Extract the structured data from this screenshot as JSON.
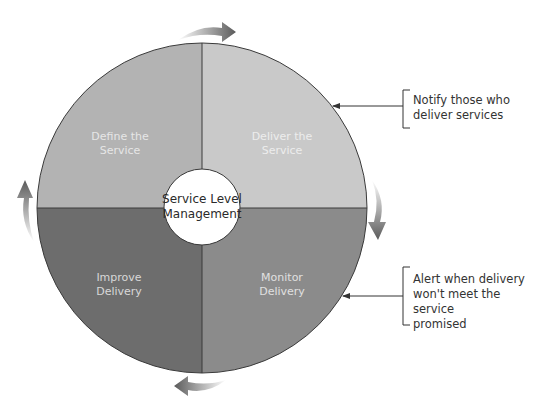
{
  "diagram": {
    "center": {
      "line1": "Service Level",
      "line2": "Management"
    },
    "quadrants": [
      {
        "position": "top-left",
        "line1": "Define the",
        "line2": "Service",
        "fill": "#b3b3b3",
        "text_color": "#e6e6e6"
      },
      {
        "position": "top-right",
        "line1": "Deliver the",
        "line2": "Service",
        "fill": "#c9c9c9",
        "text_color": "#ededed"
      },
      {
        "position": "bottom-right",
        "line1": "Monitor",
        "line2": "Delivery",
        "fill": "#8b8b8b",
        "text_color": "#e0e0e0"
      },
      {
        "position": "bottom-left",
        "line1": "Improve",
        "line2": "Delivery",
        "fill": "#6d6d6d",
        "text_color": "#d8d8d8"
      }
    ],
    "cycle_arrows": [
      {
        "position": "top",
        "direction": "clockwise"
      },
      {
        "position": "right",
        "direction": "clockwise"
      },
      {
        "position": "bottom",
        "direction": "clockwise"
      },
      {
        "position": "left",
        "direction": "clockwise"
      }
    ],
    "callouts": [
      {
        "target": "Deliver the Service",
        "line1": "Notify those who",
        "line2": "deliver services"
      },
      {
        "target": "Monitor Delivery",
        "line1": "Alert when delivery",
        "line2": "won't meet the service",
        "line3": "promised"
      }
    ]
  }
}
